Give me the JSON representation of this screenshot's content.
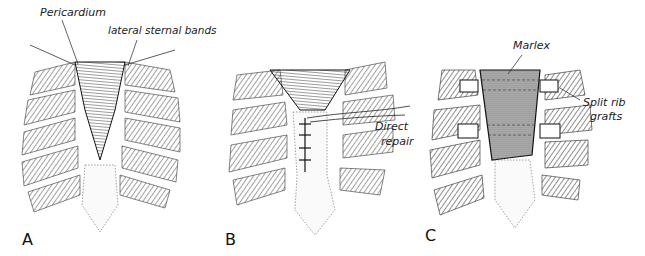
{
  "figure": {
    "panels": [
      {
        "id": "A",
        "letter": "A",
        "annotations": [
          "Pericardium",
          "lateral sternal bands"
        ]
      },
      {
        "id": "B",
        "letter": "B",
        "annotations": [
          "Direct",
          "repair"
        ]
      },
      {
        "id": "C",
        "letter": "C",
        "annotations": [
          "Marlex",
          "Split rib",
          "grafts"
        ]
      }
    ],
    "colors": {
      "ink": "#1a1a1a",
      "hatch": "#555555",
      "background": "#ffffff"
    }
  }
}
